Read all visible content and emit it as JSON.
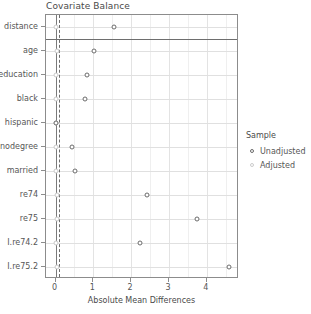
{
  "chart_data": {
    "type": "scatter",
    "title": "Covariate Balance",
    "xlabel": "Absolute Mean Differences",
    "ylabel": "",
    "xlim": [
      -0.25,
      4.85
    ],
    "xticks": [
      0,
      1,
      2,
      3,
      4
    ],
    "xticklabels": [
      "0",
      "1",
      "2",
      "3",
      "4"
    ],
    "categories": [
      "distance",
      "age",
      "education",
      "black",
      "hispanic",
      "nodegree",
      "married",
      "re74",
      "re75",
      "I.re74.2",
      "I.re75.2"
    ],
    "series": [
      {
        "name": "Unadjusted",
        "color": "#6b6b6b",
        "marker": "open-circle",
        "values": [
          1.55,
          1.03,
          0.82,
          0.79,
          0.02,
          0.43,
          0.52,
          2.42,
          3.73,
          2.24,
          4.58
        ]
      },
      {
        "name": "Adjusted",
        "color": "#c9c9c9",
        "marker": "open-circle",
        "values": [
          0.0,
          0.03,
          0.02,
          0.0,
          0.0,
          0.0,
          0.0,
          0.03,
          0.04,
          0.02,
          0.03
        ]
      }
    ],
    "reference_lines": [
      {
        "name": "zero-line",
        "x": 0,
        "style": "solid",
        "color": "#7a7a7a"
      },
      {
        "name": "threshold-line",
        "x": 0.1,
        "style": "dashed",
        "color": "#6e6e6e"
      }
    ],
    "separator_after_category": "distance",
    "grid": true,
    "legend": {
      "title": "Sample",
      "position": "right",
      "entries": [
        "Unadjusted",
        "Adjusted"
      ]
    }
  },
  "legend": {
    "title": "Sample",
    "items": [
      {
        "label": "Unadjusted",
        "marker_name": "legend-marker-unadjusted"
      },
      {
        "label": "Adjusted",
        "marker_name": "legend-marker-adjusted"
      }
    ]
  }
}
